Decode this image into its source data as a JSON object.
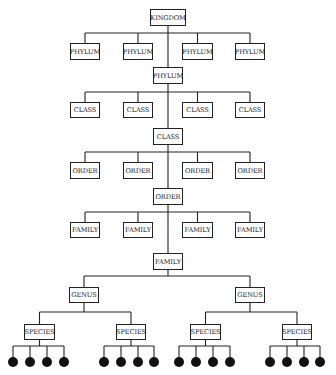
{
  "diagram": {
    "type": "taxonomy-hierarchy",
    "root": {
      "label": "KINGDOM",
      "x": 150,
      "y": 9,
      "w": 36,
      "h": 17
    },
    "levels": [
      {
        "name": "phylum",
        "bar_y": 33,
        "siblings": [
          {
            "label": "PHYLUM",
            "x": 70,
            "y": 43,
            "w": 30,
            "h": 17
          },
          {
            "label": "PHYLUM",
            "x": 123,
            "y": 43,
            "w": 30,
            "h": 17
          },
          {
            "label": "PHYLUM",
            "x": 182,
            "y": 43,
            "w": 31,
            "h": 17
          },
          {
            "label": "PHYLUM",
            "x": 235,
            "y": 43,
            "w": 30,
            "h": 17
          }
        ],
        "selected": {
          "label": "PHYLUM",
          "x": 153,
          "y": 67,
          "w": 30,
          "h": 17
        }
      },
      {
        "name": "class",
        "bar_y": 92,
        "siblings": [
          {
            "label": "CLASS",
            "x": 70,
            "y": 102,
            "w": 30,
            "h": 16
          },
          {
            "label": "CLASS",
            "x": 123,
            "y": 102,
            "w": 30,
            "h": 16
          },
          {
            "label": "CLASS",
            "x": 182,
            "y": 102,
            "w": 31,
            "h": 16
          },
          {
            "label": "CLASS",
            "x": 235,
            "y": 102,
            "w": 30,
            "h": 16
          }
        ],
        "selected": {
          "label": "CLASS",
          "x": 153,
          "y": 128,
          "w": 30,
          "h": 17
        }
      },
      {
        "name": "order",
        "bar_y": 152,
        "siblings": [
          {
            "label": "ORDER",
            "x": 70,
            "y": 162,
            "w": 30,
            "h": 17
          },
          {
            "label": "ORDER",
            "x": 123,
            "y": 162,
            "w": 30,
            "h": 17
          },
          {
            "label": "ORDER",
            "x": 182,
            "y": 162,
            "w": 31,
            "h": 17
          },
          {
            "label": "ORDER",
            "x": 235,
            "y": 162,
            "w": 30,
            "h": 17
          }
        ],
        "selected": {
          "label": "ORDER",
          "x": 153,
          "y": 188,
          "w": 30,
          "h": 17
        }
      },
      {
        "name": "family",
        "bar_y": 212,
        "siblings": [
          {
            "label": "FAMILY",
            "x": 70,
            "y": 222,
            "w": 30,
            "h": 16
          },
          {
            "label": "FAMILY",
            "x": 123,
            "y": 222,
            "w": 30,
            "h": 16
          },
          {
            "label": "FAMILY",
            "x": 182,
            "y": 222,
            "w": 31,
            "h": 16
          },
          {
            "label": "FAMILY",
            "x": 235,
            "y": 222,
            "w": 30,
            "h": 16
          }
        ],
        "selected": {
          "label": "FAMILY",
          "x": 153,
          "y": 253,
          "w": 30,
          "h": 17
        }
      }
    ],
    "genus_bar_y": 276,
    "genera": [
      {
        "label": "GENUS",
        "x": 69,
        "y": 287,
        "w": 30,
        "h": 16,
        "bar_y": 312,
        "species": [
          {
            "label": "SPECIES",
            "x": 24,
            "y": 324,
            "w": 31,
            "h": 16,
            "dots": [
              13,
              30,
              47,
              64
            ]
          },
          {
            "label": "SPECIES",
            "x": 116,
            "y": 324,
            "w": 30,
            "h": 16,
            "dots": [
              104,
              121,
              138,
              154
            ]
          }
        ]
      },
      {
        "label": "GENUS",
        "x": 235,
        "y": 287,
        "w": 30,
        "h": 16,
        "bar_y": 312,
        "species": [
          {
            "label": "SPECIES",
            "x": 190,
            "y": 324,
            "w": 31,
            "h": 16,
            "dots": [
              179,
              196,
              213,
              230
            ]
          },
          {
            "label": "SPECIES",
            "x": 282,
            "y": 324,
            "w": 30,
            "h": 16,
            "dots": [
              270,
              287,
              304,
              320
            ]
          }
        ]
      }
    ],
    "dot_bar_y": 346,
    "dot_y": 362,
    "dot_r": 5,
    "colors": {
      "line": "#222222",
      "dot": "#111111",
      "box_border": "#222222",
      "background": "#ffffff"
    }
  }
}
